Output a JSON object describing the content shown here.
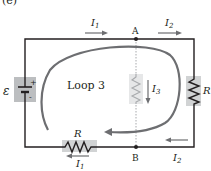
{
  "figure": {
    "panel_label": "(e)",
    "loop_label": "Loop 3",
    "emf_symbol": "ε",
    "battery_plus": "+",
    "battery_minus": "-",
    "node_a": "A",
    "node_b": "B",
    "resistor_label": "R",
    "currents": {
      "top_left": {
        "name": "I",
        "sub": "1",
        "direction": "right"
      },
      "top_right": {
        "name": "I",
        "sub": "2",
        "direction": "right"
      },
      "middle": {
        "name": "I",
        "sub": "3",
        "direction": "down"
      },
      "bottom_left": {
        "name": "I",
        "sub": "1",
        "direction": "left"
      },
      "bottom_right": {
        "name": "I",
        "sub": "2",
        "direction": "left"
      }
    },
    "colors": {
      "wire": "#231f20",
      "arrow": "#6d6e71",
      "highlight": "#bcbec0",
      "faded_wire": "#a7a9ac"
    }
  }
}
